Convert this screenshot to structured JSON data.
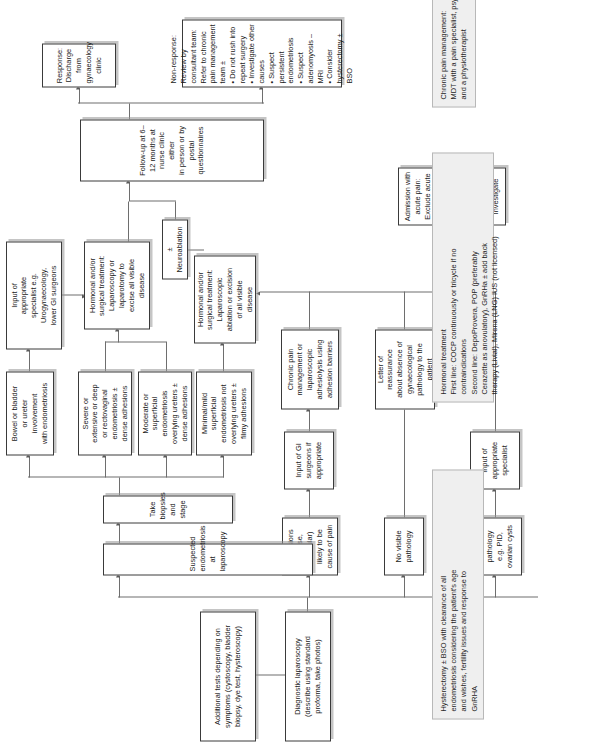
{
  "nodes": {
    "additional_tests": "Additional tests depending on\nsymptoms (cystoscopy, bladder\nbiopsy, dye test, hysteroscopy)",
    "diagnostic_laparoscopy": "Diagnostic laparoscopy\n(describe using standard\nproforma, take photos)",
    "other_pathology": "Other pathology\ne.g. PID,\novarian cysts",
    "no_visible_pathology": "No visible\npathology",
    "adhesions": "Adhesions\n(dense, vascular)\nlikely to be\ncause of pain",
    "suspected_endometriosis": "Suspected endometriosis at laparoscopy",
    "take_biopsies": "Take biopsies and stage",
    "input_appropriate_specialist": "Input of\nappropriate\nspecialist",
    "input_gi_surgeons": "Input of GI\nsurgeons if\nappropriate",
    "minimal_mild": "Minimal/mild\nsuperficial\nendometriosis not\noverlying ureters ±\nfilmy adhesions",
    "moderate_superficial": "Moderate or\nsuperficial\nendometriosis\noverlying ureters ±\ndense adhesions",
    "severe_extensive": "Severe or\nextensive or deep\nor rectovaginal\nendometriosis ±\ndense adhesions",
    "bowel_bladder": "Bowel or bladder\nor ureter\ninvolvement\nwith endometriosis",
    "letter_reassurance": "Letter of\nreassurance\nabout absence of\ngynaecological\npathology to the\npatient",
    "chronic_pain_adhesiolysis": "Chronic pain\nmanagement or\nlaparoscopic\nadhesiolysis using\nadhesion barriers",
    "hormonal_ablation": "Hormonal and/or\nsurgical treatment:\nLaparoscopic\nablation or excision\nof all visible\ndisease",
    "hormonal_excise": "Hormonal and/or\nsurgical treatment:\nLaparoscopy or\nlaparotomy to\nexcise all visible\ndisease",
    "input_specialist_urogynae": "Input of\nappropriate\nspecialist e.g.\nUrogynaecology,\nlower GI surgeons",
    "neuroablation": "± Neuroablation",
    "follow_up": "Follow-up at 6–12 months at nurse clinic either\nin person or by postal questionnaires",
    "response_discharge": "Response: Discharge from\ngynaecology clinic",
    "non_response": "Non-response: Review by consultant team:\nRefer to chronic pain management team ±\n• Do not rush into repeat surgery\n• Investigate other causes\n• Suspect persistent endometriosis\n• Suspect adenomyosis – MRI\n• Consider hysterectomy ± BSO",
    "admission_acute_pain": "Admission with acute pain:\nExclude acute abdomen\nDo not rush into surgery\nPain management service\nInvestigate"
  },
  "side_notes": {
    "chronic_pain_management": "Chronic pain management:\nMDT with a pain specialist, psychologist\nand a physiotherapist",
    "hormonal_treatment": "Hormonal treatment\nFirst line: COCP continuously or tricycle if no\ncontraindications\nSecond line: DepoProvera, POP (preferably\nCerazette as anovulatory), GnRHa ± add back\ntherapy (Livial), Mirena (LNG) IUS (not licensed)",
    "hysterectomy": "Hysterectomy ± BSO with clearance of all\nendometriosis considering the patient's age\nand wishes, fertility issues and response to\nGnRHA"
  },
  "colors": {
    "node_border": "#3a3a3a",
    "node_fill": "#ffffff",
    "note_fill": "#efefef",
    "note_border": "#b8b8b8",
    "connector": "#6e6e6e"
  }
}
